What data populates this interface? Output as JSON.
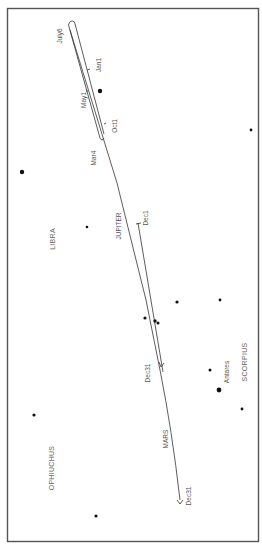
{
  "figure": {
    "constellations": [
      "LIBRA",
      "SCORPIUS",
      "OPHIUCHUS"
    ],
    "stars": [
      {
        "name": "Antares",
        "label": "Antares",
        "size": "large"
      }
    ],
    "planets": [
      {
        "name": "JUPITER",
        "date_labels": [
          "July6",
          "Jan1",
          "May1",
          "Oct1",
          "Mar4",
          "Dec1",
          "Dec31"
        ]
      },
      {
        "name": "MARS",
        "date_labels": [
          "Dec31"
        ]
      }
    ]
  },
  "labels": {
    "july6": "July6",
    "jan1": "Jan1",
    "may1": "May1",
    "oct1": "Oct1",
    "mar4": "Mar4",
    "libra": "LIBRA",
    "jupiter": "JUPITER",
    "dec1": "Dec1",
    "dec31_jupiter": "Dec31",
    "antares": "Antares",
    "scorpius": "SCORPIUS",
    "mars": "MARS",
    "ophiuchus": "OPHIUCHUS",
    "dec31_mars": "Dec31"
  }
}
